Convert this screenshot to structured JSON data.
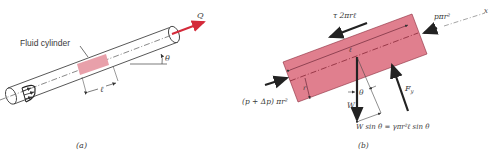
{
  "figure_a": {
    "caption": "(a)",
    "fluid_label": "Fluid cylinder",
    "flow_label": "Q",
    "angle_label": "θ",
    "length_label": "ℓ"
  },
  "figure_b": {
    "caption": "(b)",
    "shear_force": "τ 2πrℓ",
    "right_pressure": "pπr²",
    "axis_label": "x",
    "left_pressure": "(p + Δp) πr²",
    "length_label": "ℓ",
    "radius_label": "r",
    "angle_label": "θ",
    "weight_label": "W",
    "normal_force": "F",
    "normal_force_sub": "y",
    "weight_component": "W sin θ = γπr²ℓ sin θ"
  },
  "colors": {
    "fluid_fill": "#e8a0aa",
    "fluid_fill_b": "#e07f8e",
    "flow_arrow": "#d42a3a",
    "line": "#333333"
  }
}
